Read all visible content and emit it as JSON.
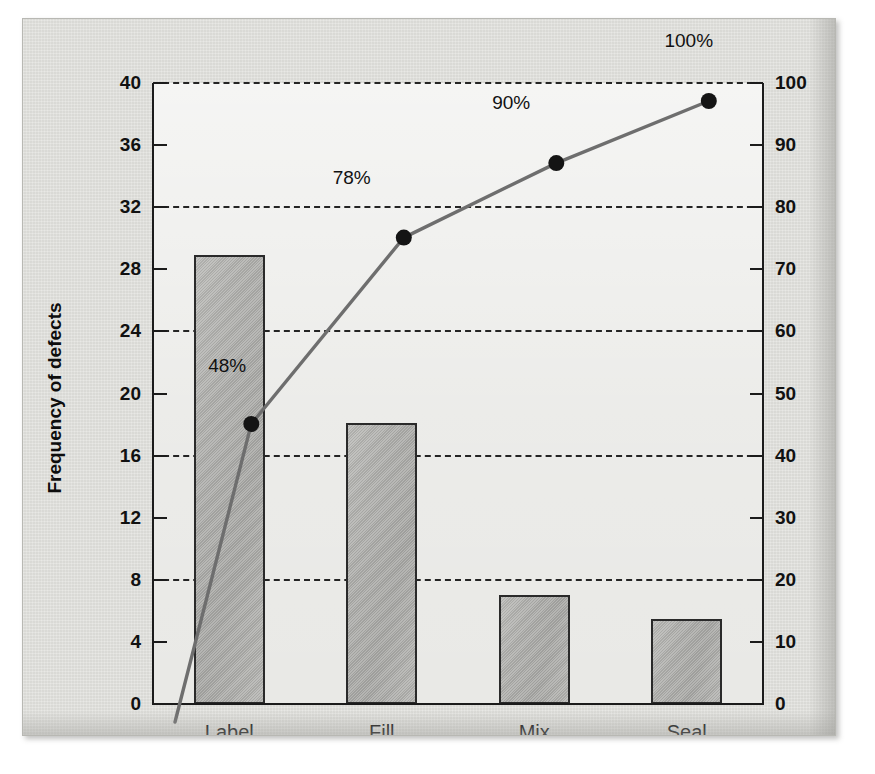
{
  "chart_data": {
    "type": "bar",
    "title": "",
    "subtitle": "",
    "categories": [
      "Label",
      "Fill",
      "Mix",
      "Seal"
    ],
    "values": [
      28.9,
      18.1,
      7.0,
      5.5
    ],
    "series": [
      {
        "name": "Frequency of defects",
        "values": [
          28.9,
          18.1,
          7.0,
          5.5
        ]
      },
      {
        "name": "Cumulative percentage of defects",
        "values": [
          48,
          78,
          90,
          100
        ]
      }
    ],
    "cumulative_percent": [
      48,
      78,
      90,
      100
    ],
    "cumulative_labels": [
      "48%",
      "78%",
      "90%",
      "100%"
    ],
    "xlabel": "",
    "ylabel": "Frequency of defects",
    "y2label": "Cumulative percentage of defects",
    "ylim": [
      0,
      40
    ],
    "y2lim": [
      0,
      100
    ],
    "yticks": [
      0,
      4,
      8,
      12,
      16,
      20,
      24,
      28,
      32,
      36,
      40
    ],
    "y2ticks": [
      0,
      10,
      20,
      30,
      40,
      50,
      60,
      70,
      80,
      90,
      100
    ],
    "gridlines": [
      8,
      16,
      24,
      32,
      40
    ],
    "grid": true,
    "legend": "none",
    "origin_value": 0,
    "colors": {
      "bar_fill": "#aeaeab",
      "bar_edge": "#2a2a2a",
      "line": "#6e6e6e",
      "marker": "#141414",
      "plot_background": "#e9e9e6",
      "plate_background": "#dededa",
      "axis": "#1b1b1b",
      "text": "#111111"
    }
  },
  "axes": {
    "left": {
      "title": "Frequency of defects",
      "tick_labels": [
        "40",
        "36",
        "32",
        "28",
        "24",
        "20",
        "16",
        "12",
        "8",
        "4",
        "0"
      ]
    },
    "right": {
      "title": "Cumulative percentage of defects",
      "tick_labels": [
        "100",
        "90",
        "80",
        "70",
        "60",
        "50",
        "40",
        "30",
        "20",
        "10",
        "0"
      ]
    },
    "bottom": {
      "tick_labels": [
        "Label",
        "Fill",
        "Mix",
        "Seal"
      ]
    }
  },
  "annotations": [
    {
      "text": "48%"
    },
    {
      "text": "78%"
    },
    {
      "text": "90%"
    },
    {
      "text": "100%"
    }
  ]
}
